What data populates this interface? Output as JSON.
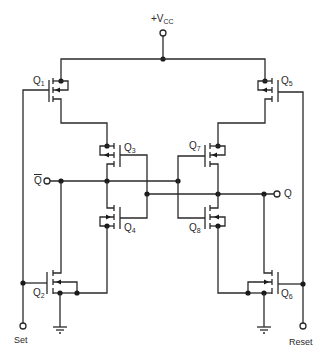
{
  "diagram": {
    "supply": {
      "label_prefix": "+V",
      "label_sub": "CC"
    },
    "terminals": {
      "qbar": "Q",
      "q": "Q",
      "set": "Set",
      "reset": "Reset"
    },
    "transistors": [
      {
        "id": "Q1",
        "letter": "Q",
        "sub": "1",
        "type": "PMOS"
      },
      {
        "id": "Q2",
        "letter": "Q",
        "sub": "2",
        "type": "NMOS"
      },
      {
        "id": "Q3",
        "letter": "Q",
        "sub": "3",
        "type": "PMOS"
      },
      {
        "id": "Q4",
        "letter": "Q",
        "sub": "4",
        "type": "NMOS"
      },
      {
        "id": "Q5",
        "letter": "Q",
        "sub": "5",
        "type": "PMOS"
      },
      {
        "id": "Q6",
        "letter": "Q",
        "sub": "6",
        "type": "NMOS"
      },
      {
        "id": "Q7",
        "letter": "Q",
        "sub": "7",
        "type": "PMOS"
      },
      {
        "id": "Q8",
        "letter": "Q",
        "sub": "8",
        "type": "NMOS"
      }
    ],
    "colors": {
      "line": "#2a2a2a",
      "background": "#ffffff"
    }
  }
}
